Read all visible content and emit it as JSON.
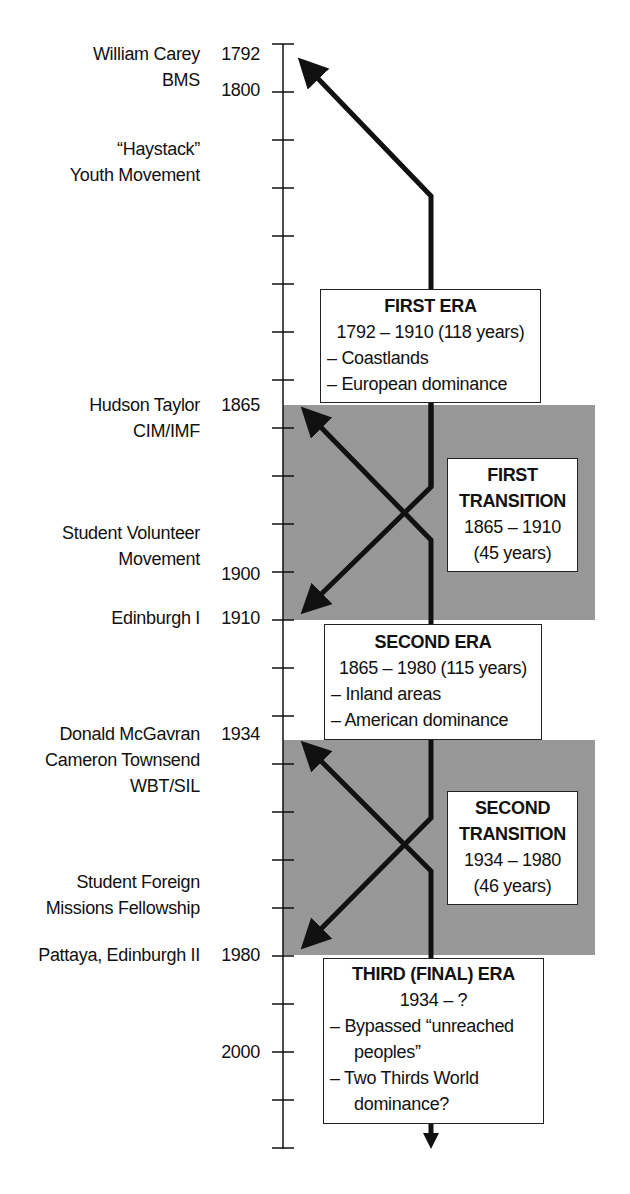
{
  "timeline": {
    "axis": {
      "x": 283,
      "first_tick_y": 44,
      "tick_spacing": 48,
      "tick_count": 24,
      "year_labels": [
        {
          "year": "1792",
          "y": 41
        },
        {
          "year": "1800",
          "y": 77
        },
        {
          "year": "1865",
          "y": 392
        },
        {
          "year": "1900",
          "y": 561
        },
        {
          "year": "1910",
          "y": 605
        },
        {
          "year": "1934",
          "y": 721
        },
        {
          "year": "1980",
          "y": 942
        },
        {
          "year": "2000",
          "y": 1039
        }
      ]
    },
    "events": [
      {
        "lines": [
          "William Carey",
          "BMS"
        ],
        "y": 41
      },
      {
        "lines": [
          "“Haystack”",
          "Youth Movement"
        ],
        "y": 136
      },
      {
        "lines": [
          "Hudson Taylor",
          "CIM/IMF"
        ],
        "y": 392
      },
      {
        "lines": [
          "Student Volunteer",
          "Movement"
        ],
        "y": 520
      },
      {
        "lines": [
          "Edinburgh I"
        ],
        "y": 605
      },
      {
        "lines": [
          "Donald McGavran",
          "Cameron Townsend",
          "WBT/SIL"
        ],
        "y": 721
      },
      {
        "lines": [
          "Student Foreign",
          "Missions Fellowship"
        ],
        "y": 869
      },
      {
        "lines": [
          "Pattaya, Edinburgh II"
        ],
        "y": 942
      }
    ],
    "eras": {
      "first": {
        "title": "FIRST ERA",
        "range": "1792 – 1910 (118 years)",
        "bullets": [
          "– Coastlands",
          "– European dominance"
        ]
      },
      "second": {
        "title": "SECOND ERA",
        "range": "1865 – 1980 (115 years)",
        "bullets": [
          "– Inland areas",
          "– American dominance"
        ]
      },
      "third": {
        "title": "THIRD (FINAL) ERA",
        "range": "1934 – ?",
        "bullets": [
          "– Bypassed “unreached",
          "peoples”",
          "– Two Thirds World",
          "dominance?"
        ]
      }
    },
    "transitions": {
      "first": {
        "title_1": "FIRST",
        "title_2": "TRANSITION",
        "range": "1865 – 1910",
        "duration": "(45 years)"
      },
      "second": {
        "title_1": "SECOND",
        "title_2": "TRANSITION",
        "range": "1934 – 1980",
        "duration": "(46 years)"
      }
    },
    "colors": {
      "line": "#111111",
      "band": "#a9a9a9",
      "box_bg": "#ffffff"
    }
  }
}
